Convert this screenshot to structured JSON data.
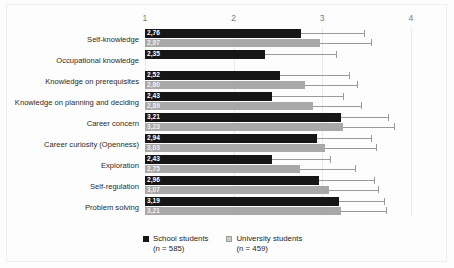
{
  "chart_data": {
    "type": "bar",
    "orientation": "horizontal",
    "title": "",
    "xlabel": "",
    "ylabel": "",
    "xlim": [
      1,
      4
    ],
    "xticks": [
      "1",
      "2",
      "3",
      "4"
    ],
    "grid": true,
    "legend_position": "bottom",
    "decimal_separator": ",",
    "categories": [
      "Self-knowledge",
      "Occupational knowledge",
      "Knowledge on prerequisites",
      "Knowledge on planning and deciding",
      "Career concern",
      "Career curiosity (Openness)",
      "Exploration",
      "Self-regulation",
      "Problem solving"
    ],
    "series": [
      {
        "name": "School students",
        "n": "585",
        "legend_label": "School students",
        "legend_sub": "(n = 585)",
        "color": "#161616",
        "values": [
          2.76,
          2.35,
          2.52,
          2.43,
          3.21,
          2.94,
          2.43,
          2.96,
          3.19
        ],
        "value_labels": [
          "2,76",
          "2,35",
          "2,52",
          "2,43",
          "3,21",
          "2,94",
          "2,43",
          "2,96",
          "3,19"
        ],
        "error_upper": [
          3.47,
          3.15,
          3.3,
          3.23,
          3.74,
          3.55,
          3.09,
          3.58,
          3.7
        ]
      },
      {
        "name": "University students",
        "n": "459",
        "legend_label": "University students",
        "legend_sub": "(n = 459)",
        "color": "#a8a8a8",
        "values": [
          2.97,
          null,
          2.8,
          2.89,
          3.23,
          3.03,
          2.75,
          3.07,
          3.21
        ],
        "value_labels": [
          "2,97",
          "",
          "2,80",
          "2,89",
          "3,23",
          "3,03",
          "2,75",
          "3,07",
          "3,21"
        ],
        "error_upper": [
          3.55,
          null,
          3.39,
          3.44,
          3.81,
          3.6,
          3.37,
          3.63,
          3.72
        ]
      }
    ]
  },
  "legend": {
    "items": [
      {
        "label": "School students",
        "sub": "(n = 585)"
      },
      {
        "label": "University students",
        "sub": "(n = 459)"
      }
    ]
  }
}
